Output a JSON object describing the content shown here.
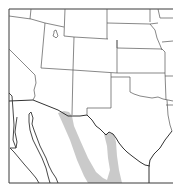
{
  "map": {
    "type": "range-map",
    "region": "Southwestern United States and northern Mexico",
    "colors": {
      "background": "#ffffff",
      "range_fill": "#c4c4c4",
      "border_stroke": "#3a3a3a",
      "state_stroke": "#555555"
    },
    "layers": [
      {
        "name": "frame"
      },
      {
        "name": "state-boundaries"
      },
      {
        "name": "international-border"
      },
      {
        "name": "coastline"
      },
      {
        "name": "range-shading"
      }
    ]
  }
}
